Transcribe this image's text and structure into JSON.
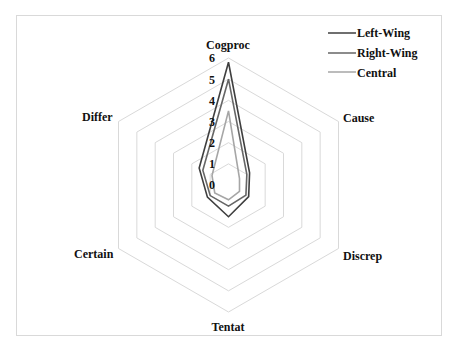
{
  "chart_data": {
    "type": "radar",
    "title": "",
    "axes": [
      "Cogproc",
      "Cause",
      "Discrep",
      "Tentat",
      "Certain",
      "Differ"
    ],
    "rlim": [
      0,
      6
    ],
    "ticks": [
      0,
      1,
      2,
      3,
      4,
      5,
      6
    ],
    "grid": true,
    "legend_position": "top-right",
    "series": [
      {
        "name": "Left-Wing",
        "color": "#3f3f3f",
        "values": [
          5.8,
          1.15,
          1.1,
          1.5,
          1.15,
          1.6
        ]
      },
      {
        "name": "Right-Wing",
        "color": "#666666",
        "values": [
          5.0,
          1.0,
          0.95,
          1.0,
          1.0,
          1.4
        ]
      },
      {
        "name": "Central",
        "color": "#a6a6a6",
        "values": [
          3.5,
          0.6,
          0.6,
          0.7,
          0.75,
          0.9
        ]
      }
    ]
  },
  "legend": {
    "items": [
      {
        "label": "Left-Wing",
        "color": "#3f3f3f"
      },
      {
        "label": "Right-Wing",
        "color": "#666666"
      },
      {
        "label": "Central",
        "color": "#a6a6a6"
      }
    ]
  },
  "axis_labels": {
    "cogproc": "Cogproc",
    "cause": "Cause",
    "discrep": "Discrep",
    "tentat": "Tentat",
    "certain": "Certain",
    "differ": "Differ"
  },
  "tick_labels": [
    "0",
    "1",
    "2",
    "3",
    "4",
    "5",
    "6"
  ],
  "style": {
    "grid_color": "#d9d9d9",
    "frame_color": "#d9d9d9"
  }
}
